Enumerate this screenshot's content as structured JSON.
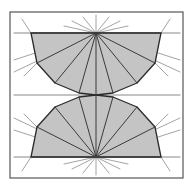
{
  "figure": {
    "canvas": {
      "width": 193,
      "height": 187,
      "background": "#ffffff"
    },
    "colors": {
      "frame_stroke": "#555555",
      "polygon_fill": "#c4c4c4",
      "polygon_stroke": "#2b2b2b",
      "chord_stroke": "#3a3a3a",
      "construction_stroke": "#8c8c8c",
      "baseline_stroke": "#6b6b6b"
    },
    "stroke_widths": {
      "frame": 1.2,
      "polygon": 1.3,
      "chord": 1.0,
      "construction": 0.8,
      "baseline": 0.8
    },
    "frame": {
      "x": 10,
      "y": 12,
      "width": 173,
      "height": 166
    },
    "apexes": {
      "top_label": "upper apex",
      "top": {
        "x": 96,
        "y": 33
      },
      "bottom_label": "lower apex",
      "bottom": {
        "x": 96,
        "y": 157
      }
    },
    "baselines": [
      {
        "name": "upper-baseline",
        "x1": 14,
        "y1": 33,
        "x2": 180,
        "y2": 33
      },
      {
        "name": "mid-baseline",
        "x1": 14,
        "y1": 95,
        "x2": 180,
        "y2": 95
      },
      {
        "name": "lower-baseline",
        "x1": 14,
        "y1": 157,
        "x2": 180,
        "y2": 157
      }
    ],
    "polygons": [
      {
        "name": "upper-fan-polygon",
        "points": "31,33 96,33 161,33 155,63 137,83 113,93 96,95 79,93 55,83 37,63"
      },
      {
        "name": "lower-fan-polygon",
        "points": "161,157 96,157 31,157 37,127 55,107 79,97 96,95 113,97 137,107 155,127"
      }
    ],
    "chords": {
      "upper": [
        {
          "x1": 96,
          "y1": 33,
          "x2": 31,
          "y2": 33
        },
        {
          "x1": 96,
          "y1": 33,
          "x2": 37,
          "y2": 63
        },
        {
          "x1": 96,
          "y1": 33,
          "x2": 55,
          "y2": 83
        },
        {
          "x1": 96,
          "y1": 33,
          "x2": 79,
          "y2": 93
        },
        {
          "x1": 96,
          "y1": 33,
          "x2": 96,
          "y2": 95
        },
        {
          "x1": 96,
          "y1": 33,
          "x2": 113,
          "y2": 93
        },
        {
          "x1": 96,
          "y1": 33,
          "x2": 137,
          "y2": 83
        },
        {
          "x1": 96,
          "y1": 33,
          "x2": 155,
          "y2": 63
        },
        {
          "x1": 96,
          "y1": 33,
          "x2": 161,
          "y2": 33
        }
      ],
      "lower": [
        {
          "x1": 96,
          "y1": 157,
          "x2": 31,
          "y2": 157
        },
        {
          "x1": 96,
          "y1": 157,
          "x2": 37,
          "y2": 127
        },
        {
          "x1": 96,
          "y1": 157,
          "x2": 55,
          "y2": 107
        },
        {
          "x1": 96,
          "y1": 157,
          "x2": 79,
          "y2": 97
        },
        {
          "x1": 96,
          "y1": 157,
          "x2": 96,
          "y2": 95
        },
        {
          "x1": 96,
          "y1": 157,
          "x2": 113,
          "y2": 97
        },
        {
          "x1": 96,
          "y1": 157,
          "x2": 137,
          "y2": 107
        },
        {
          "x1": 96,
          "y1": 157,
          "x2": 155,
          "y2": 127
        },
        {
          "x1": 96,
          "y1": 157,
          "x2": 161,
          "y2": 157
        }
      ]
    },
    "construction_rays": {
      "from_top_apex": [
        {
          "x1": 96,
          "y1": 33,
          "x2": 96,
          "y2": 15
        },
        {
          "x1": 96,
          "y1": 33,
          "x2": 83,
          "y2": 17
        },
        {
          "x1": 96,
          "y1": 33,
          "x2": 109,
          "y2": 17
        },
        {
          "x1": 96,
          "y1": 33,
          "x2": 72,
          "y2": 21
        },
        {
          "x1": 96,
          "y1": 33,
          "x2": 120,
          "y2": 21
        },
        {
          "x1": 96,
          "y1": 33,
          "x2": 64,
          "y2": 26
        },
        {
          "x1": 96,
          "y1": 33,
          "x2": 128,
          "y2": 26
        },
        {
          "x1": 96,
          "y1": 33,
          "x2": 14,
          "y2": 72
        },
        {
          "x1": 96,
          "y1": 33,
          "x2": 180,
          "y2": 72
        },
        {
          "x1": 96,
          "y1": 33,
          "x2": 14,
          "y2": 60
        },
        {
          "x1": 96,
          "y1": 33,
          "x2": 180,
          "y2": 60
        }
      ],
      "from_bottom_apex": [
        {
          "x1": 96,
          "y1": 157,
          "x2": 96,
          "y2": 175
        },
        {
          "x1": 96,
          "y1": 157,
          "x2": 83,
          "y2": 173
        },
        {
          "x1": 96,
          "y1": 157,
          "x2": 109,
          "y2": 173
        },
        {
          "x1": 96,
          "y1": 157,
          "x2": 72,
          "y2": 169
        },
        {
          "x1": 96,
          "y1": 157,
          "x2": 120,
          "y2": 169
        },
        {
          "x1": 96,
          "y1": 157,
          "x2": 64,
          "y2": 164
        },
        {
          "x1": 96,
          "y1": 157,
          "x2": 128,
          "y2": 164
        },
        {
          "x1": 96,
          "y1": 157,
          "x2": 14,
          "y2": 118
        },
        {
          "x1": 96,
          "y1": 157,
          "x2": 180,
          "y2": 118
        },
        {
          "x1": 96,
          "y1": 157,
          "x2": 14,
          "y2": 130
        },
        {
          "x1": 96,
          "y1": 157,
          "x2": 180,
          "y2": 130
        }
      ],
      "edge_extensions": [
        {
          "x1": 31,
          "y1": 33,
          "x2": 22,
          "y2": 19
        },
        {
          "x1": 161,
          "y1": 33,
          "x2": 170,
          "y2": 19
        },
        {
          "x1": 31,
          "y1": 157,
          "x2": 22,
          "y2": 171
        },
        {
          "x1": 161,
          "y1": 157,
          "x2": 170,
          "y2": 171
        },
        {
          "x1": 37,
          "y1": 63,
          "x2": 24,
          "y2": 76
        },
        {
          "x1": 155,
          "y1": 63,
          "x2": 168,
          "y2": 76
        },
        {
          "x1": 37,
          "y1": 127,
          "x2": 24,
          "y2": 114
        },
        {
          "x1": 155,
          "y1": 127,
          "x2": 168,
          "y2": 114
        }
      ]
    }
  }
}
